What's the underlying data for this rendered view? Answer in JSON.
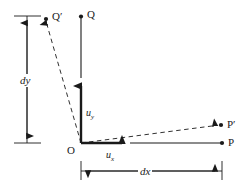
{
  "figure": {
    "type": "geometry-diagram",
    "background_color": "#ffffff",
    "stroke_color": "#1a1a1a",
    "points": {
      "origin": {
        "label": "O",
        "x": 81,
        "y": 143
      },
      "q": {
        "label": "Q",
        "x": 81,
        "y": 16
      },
      "q_prime": {
        "label": "Q′",
        "x": 46,
        "y": 18
      },
      "p": {
        "label": "P",
        "x": 222,
        "y": 143
      },
      "p_prime": {
        "label": "P′",
        "x": 222,
        "y": 125
      }
    },
    "vectors": {
      "u_y": {
        "label": "u",
        "sub": "y",
        "from_x": 81,
        "from_y": 143,
        "to_x": 81,
        "to_y": 78
      },
      "u_x": {
        "label": "u",
        "sub": "x",
        "from_x": 81,
        "from_y": 143,
        "to_x": 130,
        "to_y": 143
      }
    },
    "dimensions": {
      "dy": {
        "label": "dy",
        "orientation": "vertical",
        "x": 27,
        "top_y": 16,
        "bottom_y": 143
      },
      "dx": {
        "label": "dx",
        "orientation": "horizontal",
        "y": 171,
        "left_x": 81,
        "right_x": 222
      }
    },
    "axes": {
      "vertical": {
        "from_x": 81,
        "from_y": 143,
        "to_x": 81,
        "to_y": 16
      },
      "horizontal": {
        "from_x": 81,
        "from_y": 143,
        "to_x": 222,
        "to_y": 143
      }
    },
    "dashed_edges": [
      {
        "name": "origin-to-q-prime",
        "from_x": 81,
        "from_y": 143,
        "to_x": 46,
        "to_y": 20
      },
      {
        "name": "origin-to-p-prime",
        "from_x": 81,
        "from_y": 143,
        "to_x": 220,
        "to_y": 125
      }
    ]
  }
}
